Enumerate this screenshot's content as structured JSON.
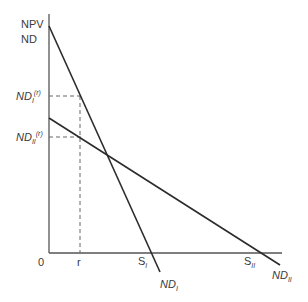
{
  "diagram": {
    "y_axis_labels": [
      "NPV",
      "ND"
    ],
    "origin_label": "0",
    "x_tick_r": "r",
    "ndI_r": {
      "base": "ND",
      "sub": "I",
      "sup": "(r)"
    },
    "ndII_r": {
      "base": "ND",
      "sub": "II",
      "sup": "(r)"
    },
    "s1": {
      "base": "S",
      "sub": "I"
    },
    "s2": {
      "base": "S",
      "sub": "II"
    },
    "ndI_end": {
      "base": "ND",
      "sub": "I"
    },
    "ndII_end": {
      "base": "ND",
      "sub": "II"
    },
    "colors": {
      "line": "#2b2b2b",
      "axis": "#555555",
      "dash": "#666666"
    }
  }
}
